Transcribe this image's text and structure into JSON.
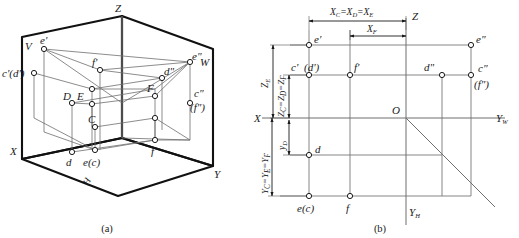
{
  "figure": {
    "panels": [
      {
        "id": "a",
        "caption": "(a)",
        "description": "three-dimensional projection box with points C D E F and their projections",
        "axis_labels": {
          "x": "X",
          "y": "Y",
          "z": "Z"
        },
        "plane_labels": {
          "vertical": "V",
          "horizontal": "H",
          "profile": "W"
        },
        "space_points": [
          "D",
          "E",
          "C",
          "F"
        ],
        "v_projections": [
          "e'",
          "f'",
          "c'(d')"
        ],
        "h_projections": [
          "d",
          "e(c)",
          "f"
        ],
        "w_projections": [
          "e\"",
          "d\"",
          "c\"",
          "(f\")"
        ]
      },
      {
        "id": "b",
        "caption": "(b)",
        "description": "unfolded two-dimensional three-view layout with coordinate dimensions",
        "axis_labels": {
          "z": "Z",
          "x": "X",
          "yw": "Y",
          "yw_sub": "W",
          "yh": "Y",
          "yh_sub": "H",
          "origin": "O"
        },
        "dimension_labels": [
          {
            "name": "x_cde",
            "base": "X",
            "sub": "C",
            "text": "X_C=X_D=X_E",
            "parts": [
              "X",
              "C",
              "=X",
              "D",
              "=X",
              "E"
            ]
          },
          {
            "name": "x_f",
            "text": "X_F",
            "parts": [
              "X",
              "F"
            ]
          },
          {
            "name": "z_e",
            "text": "Z_E",
            "parts": [
              "Z",
              "E"
            ]
          },
          {
            "name": "z_cdf",
            "text": "Z_C=Z_D=Z_F",
            "parts": [
              "Z",
              "C",
              "=Z",
              "D",
              "=Z",
              "F"
            ]
          },
          {
            "name": "y_d",
            "text": "y_D",
            "parts": [
              "y",
              "D"
            ]
          },
          {
            "name": "y_cef",
            "text": "Y_C=Y_E=Y_F",
            "parts": [
              "Y",
              "C",
              "=Y",
              "E",
              "=Y",
              "F"
            ]
          }
        ],
        "v_projections": [
          "e'",
          "c'",
          "(d')",
          "f'"
        ],
        "w_projections": [
          "e\"",
          "d\"",
          "c\"",
          "(f\")"
        ],
        "h_projections": [
          "d",
          "e(c)",
          "f"
        ]
      }
    ]
  },
  "colors": {
    "ink": "#1a1a1a",
    "thin_line": "#7a7a7a",
    "thick_line": "#111111",
    "marker_fill": "#ffffff"
  }
}
